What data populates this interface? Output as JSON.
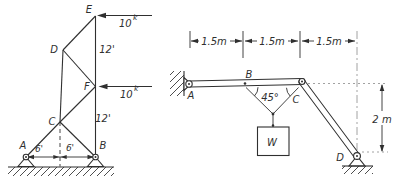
{
  "colors": {
    "background": "#ffffff",
    "ink": "#2f2f2f"
  },
  "left_truss": {
    "nodes": {
      "A": "A",
      "B": "B",
      "C": "C",
      "D": "D",
      "E": "E",
      "F": "F"
    },
    "force_top": {
      "magnitude": "10",
      "superscript": "k"
    },
    "force_mid": {
      "magnitude": "10",
      "superscript": "k"
    },
    "dims": {
      "ef": "12'",
      "fb": "12'",
      "base_left": "6'",
      "base_right": "6'"
    }
  },
  "right_frame": {
    "nodes": {
      "A": "A",
      "B": "B",
      "C": "C",
      "D": "D"
    },
    "dims": {
      "span_1": "1.5m",
      "span_2": "1.5m",
      "span_3": "1.5m",
      "height": "2 m"
    },
    "angle": "45°",
    "weight": "W"
  }
}
